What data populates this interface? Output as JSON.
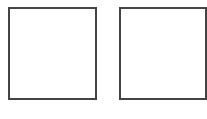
{
  "shapes": [
    {
      "type": "square",
      "position": "left",
      "fill": "#ffffff",
      "stroke": "#444444"
    },
    {
      "type": "square",
      "position": "right",
      "fill": "#ffffff",
      "stroke": "#444444"
    }
  ],
  "colors": {
    "background": "#ffffff",
    "border": "#444444"
  }
}
